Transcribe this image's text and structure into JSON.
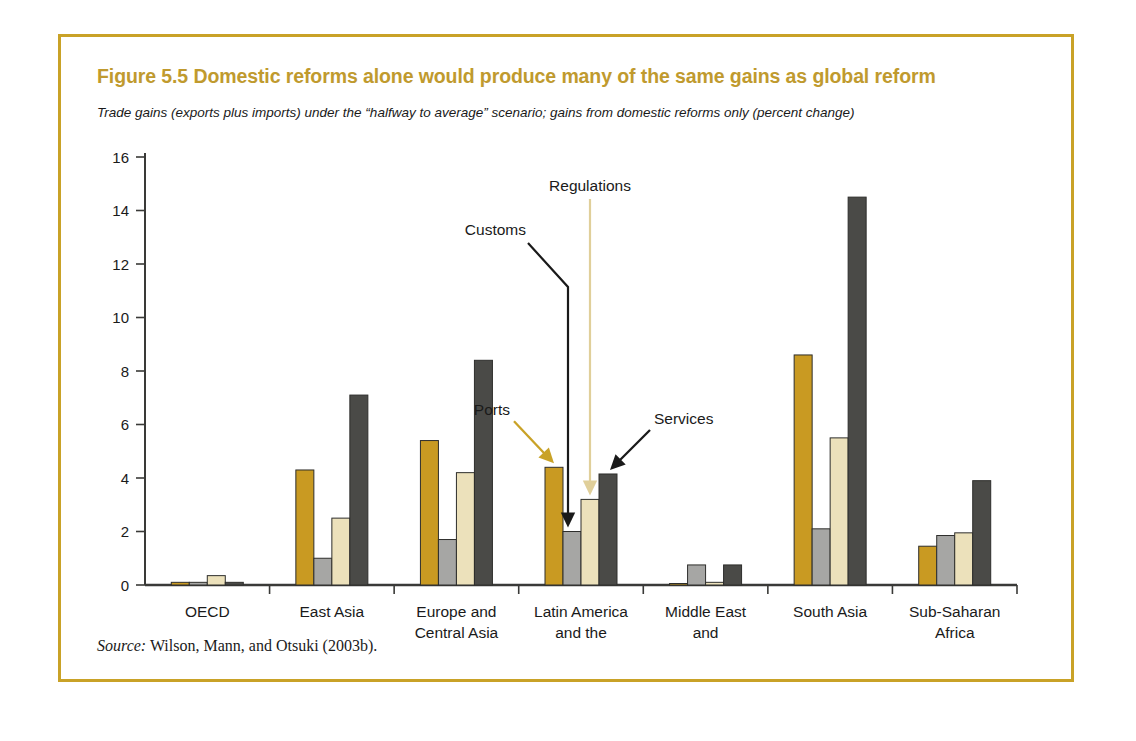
{
  "figure": {
    "number": "Figure 5.5",
    "title": "Figure 5.5  Domestic reforms alone would produce many of the same gains as global reform",
    "subtitle": "Trade gains (exports plus imports) under the “halfway to average” scenario; gains from domestic reforms only (percent change)",
    "source": "Wilson, Mann, and Otsuki (2003b).",
    "source_label": "Source:",
    "frame_color": "#c9a227",
    "title_color": "#c09a2e"
  },
  "chart_data": {
    "type": "bar",
    "title": "Figure 5.5  Domestic reforms alone would produce many of the same gains as global reform",
    "subtitle": "Trade gains (exports plus imports) under the “halfway to average” scenario; gains from domestic reforms only (percent change)",
    "xlabel": "",
    "ylabel": "",
    "ylim": [
      0,
      16
    ],
    "yticks": [
      0,
      2,
      4,
      6,
      8,
      10,
      12,
      14,
      16
    ],
    "ytick_labels": [
      "0",
      "2",
      "4",
      "6",
      "8",
      "10",
      "12",
      "14",
      "16"
    ],
    "grid": false,
    "legend": "annotated-arrows",
    "categories": [
      "OECD",
      "East Asia",
      "Europe and Central Asia",
      "Latin America and the Caribbean",
      "Middle East and North Africa",
      "South Asia",
      "Sub-Saharan Africa"
    ],
    "category_label_lines": [
      [
        "OECD"
      ],
      [
        "East Asia"
      ],
      [
        "Europe and",
        "Central Asia"
      ],
      [
        "Latin America",
        "and the",
        "Caribbean"
      ],
      [
        "Middle East",
        "and",
        "North Africa"
      ],
      [
        "South Asia"
      ],
      [
        "Sub-Saharan",
        "Africa"
      ]
    ],
    "series": [
      {
        "name": "Ports",
        "color": "#c99a22",
        "values": [
          0.1,
          4.3,
          5.4,
          4.4,
          0.05,
          8.6,
          1.45
        ]
      },
      {
        "name": "Customs",
        "color": "#a6a6a4",
        "values": [
          0.1,
          1.0,
          1.7,
          2.0,
          0.75,
          2.1,
          1.85
        ]
      },
      {
        "name": "Regulations",
        "color": "#ece1bb",
        "values": [
          0.35,
          2.5,
          4.2,
          3.2,
          0.1,
          5.5,
          1.95
        ]
      },
      {
        "name": "Services",
        "color": "#4a4a47",
        "values": [
          0.1,
          7.1,
          8.4,
          4.15,
          0.75,
          14.5,
          3.9
        ]
      }
    ],
    "annotations": [
      {
        "label": "Ports",
        "arrow_color": "#c9a227",
        "target_series": "Ports",
        "target_category": "Latin America and the Caribbean"
      },
      {
        "label": "Customs",
        "arrow_color": "#1a1a1a",
        "target_series": "Customs",
        "target_category": "Latin America and the Caribbean"
      },
      {
        "label": "Regulations",
        "arrow_color": "#e0cf9a",
        "target_series": "Regulations",
        "target_category": "Latin America and the Caribbean"
      },
      {
        "label": "Services",
        "arrow_color": "#1a1a1a",
        "target_series": "Services",
        "target_category": "Latin America and the Caribbean"
      }
    ]
  }
}
